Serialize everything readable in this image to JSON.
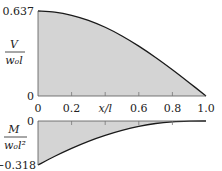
{
  "chart_data": [
    {
      "type": "area",
      "title": "",
      "ylabel": "V / w0 l",
      "xlabel": "x/l",
      "x": [
        0,
        0.1,
        0.2,
        0.3,
        0.4,
        0.5,
        0.6,
        0.7,
        0.8,
        0.9,
        1.0
      ],
      "values": [
        0.637,
        0.629,
        0.605,
        0.567,
        0.515,
        0.45,
        0.374,
        0.289,
        0.197,
        0.1,
        0.0
      ],
      "yticks": [
        "0.637",
        "0"
      ],
      "ylim": [
        0,
        0.637
      ],
      "xlim": [
        0,
        1.0
      ],
      "grid": false
    },
    {
      "type": "area",
      "title": "",
      "ylabel": "M / w0 l^2",
      "xlabel": "x/l",
      "x": [
        0,
        0.1,
        0.2,
        0.3,
        0.4,
        0.5,
        0.6,
        0.7,
        0.8,
        0.9,
        1.0
      ],
      "values": [
        -0.318,
        -0.255,
        -0.198,
        -0.147,
        -0.104,
        -0.068,
        -0.039,
        -0.018,
        -0.006,
        -0.001,
        0.0
      ],
      "yticks": [
        "0",
        "-0.318"
      ],
      "ylim": [
        -0.318,
        0
      ],
      "xlim": [
        0,
        1.0
      ],
      "grid": false
    }
  ],
  "xticks": [
    "0",
    "0.2",
    "x/l",
    "0.6",
    "0.8",
    "1.0"
  ],
  "top": {
    "ymax_label": "0.637",
    "ymin_label": "0",
    "ylabel_num": "V",
    "ylabel_den": "w₀l"
  },
  "bottom": {
    "ymax_label": "0",
    "ymin_label": "−0.318",
    "ylabel_num": "M",
    "ylabel_den": "w₀l²"
  },
  "colors": {
    "fill": "#d4d4d4",
    "line": "#1a1a1a"
  }
}
